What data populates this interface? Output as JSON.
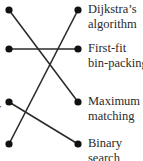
{
  "diagram": {
    "left_nodes": [
      {
        "id": "L1",
        "x": 9,
        "y": 10
      },
      {
        "id": "L2",
        "x": 9,
        "y": 49
      },
      {
        "id": "L3",
        "x": 9,
        "y": 102
      },
      {
        "id": "L4",
        "x": 9,
        "y": 144
      }
    ],
    "right_nodes": [
      {
        "id": "R1",
        "x": 78,
        "y": 10,
        "label": "Dijkstra’s\nalgorithm"
      },
      {
        "id": "R2",
        "x": 78,
        "y": 49,
        "label": "First-fit\nbin-packing"
      },
      {
        "id": "R3",
        "x": 78,
        "y": 102,
        "label": "Maximum\nmatching"
      },
      {
        "id": "R4",
        "x": 78,
        "y": 144,
        "label": "Binary\nsearch"
      }
    ],
    "edges": [
      {
        "from": "L1",
        "to": "R3"
      },
      {
        "from": "L2",
        "to": "R2"
      },
      {
        "from": "L3",
        "to": "R4"
      },
      {
        "from": "L4",
        "to": "R1"
      }
    ],
    "clipped_left_text": "r",
    "colors": {
      "line": "#2b2b2b",
      "dot": "#111111",
      "text": "#2a2a2a"
    }
  }
}
